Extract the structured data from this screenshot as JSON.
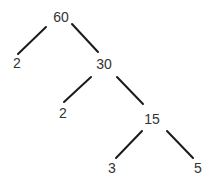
{
  "diagram": {
    "type": "factor-tree",
    "background": "#ffffff",
    "text_color": "#333333",
    "edge_color": "#1a1a1a",
    "nodes": [
      {
        "id": "n60",
        "label": "60",
        "x": 61,
        "y": 17
      },
      {
        "id": "n2a",
        "label": "2",
        "x": 17,
        "y": 63
      },
      {
        "id": "n30",
        "label": "30",
        "x": 104,
        "y": 64
      },
      {
        "id": "n2b",
        "label": "2",
        "x": 63,
        "y": 113
      },
      {
        "id": "n15",
        "label": "15",
        "x": 152,
        "y": 119
      },
      {
        "id": "n3",
        "label": "3",
        "x": 112,
        "y": 168
      },
      {
        "id": "n5",
        "label": "5",
        "x": 198,
        "y": 168
      }
    ],
    "edges": [
      {
        "from": "n60",
        "to": "n2a",
        "x1": 46,
        "y1": 27,
        "x2": 18,
        "y2": 54
      },
      {
        "from": "n60",
        "to": "n30",
        "x1": 72,
        "y1": 24,
        "x2": 98,
        "y2": 52
      },
      {
        "from": "n30",
        "to": "n2b",
        "x1": 91,
        "y1": 77,
        "x2": 64,
        "y2": 102
      },
      {
        "from": "n30",
        "to": "n15",
        "x1": 117,
        "y1": 77,
        "x2": 143,
        "y2": 104
      },
      {
        "from": "n15",
        "to": "n3",
        "x1": 142,
        "y1": 131,
        "x2": 116,
        "y2": 158
      },
      {
        "from": "n15",
        "to": "n5",
        "x1": 167,
        "y1": 131,
        "x2": 193,
        "y2": 158
      }
    ]
  }
}
